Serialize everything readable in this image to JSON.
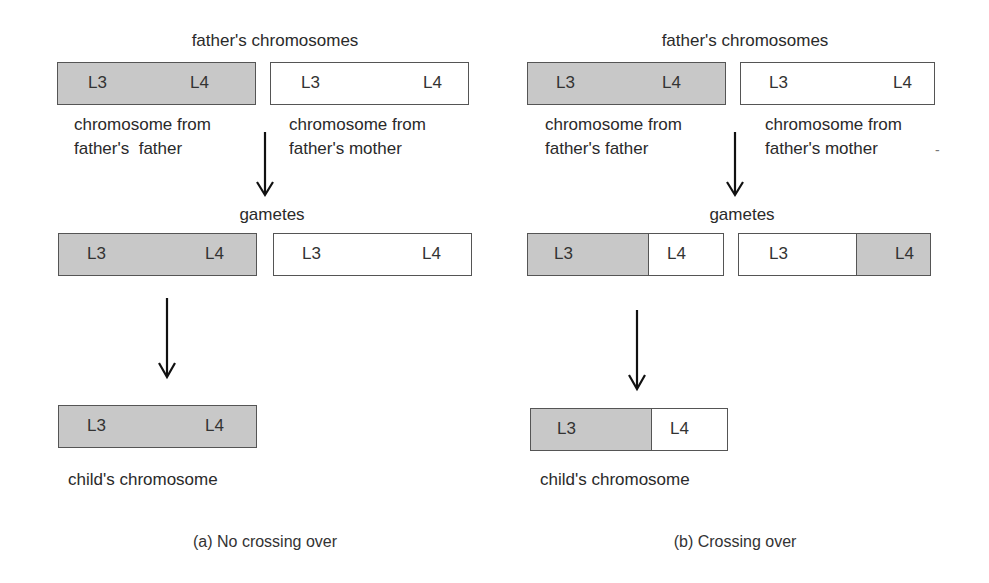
{
  "colors": {
    "maternal_segment": "#ffffff",
    "paternal_segment": "#c8c8c8",
    "outline": "#555555"
  },
  "panels": [
    {
      "id": "a",
      "caption": "(a) No crossing over",
      "parents_title": "father's chromosomes",
      "parent_chromosomes": [
        {
          "label_line1": "chromosome from",
          "label_line2": "father's  father",
          "loci": [
            "L3",
            "L4"
          ],
          "segments": [
            "grey"
          ]
        },
        {
          "label_line1": "chromosome from",
          "label_line2": "father's mother",
          "loci": [
            "L3",
            "L4"
          ],
          "segments": [
            "white"
          ]
        }
      ],
      "gametes_title": "gametes",
      "gametes": [
        {
          "loci": [
            "L3",
            "L4"
          ],
          "segments": [
            "grey"
          ]
        },
        {
          "loci": [
            "L3",
            "L4"
          ],
          "segments": [
            "white"
          ]
        }
      ],
      "child": {
        "label": "child's chromosome",
        "loci": [
          "L3",
          "L4"
        ],
        "segments": [
          "grey"
        ]
      }
    },
    {
      "id": "b",
      "caption": "(b) Crossing over",
      "parents_title": "father's chromosomes",
      "parent_chromosomes": [
        {
          "label_line1": "chromosome from",
          "label_line2": "father's father",
          "loci": [
            "L3",
            "L4"
          ],
          "segments": [
            "grey"
          ]
        },
        {
          "label_line1": "chromosome from",
          "label_line2": "father's mother",
          "loci": [
            "L3",
            "L4"
          ],
          "segments": [
            "white"
          ]
        }
      ],
      "gametes_title": "gametes",
      "gametes": [
        {
          "loci": [
            "L3",
            "L4"
          ],
          "segments": [
            "grey",
            "white"
          ]
        },
        {
          "loci": [
            "L3",
            "L4"
          ],
          "segments": [
            "white",
            "grey"
          ]
        }
      ],
      "child": {
        "label": "child's chromosome",
        "loci": [
          "L3",
          "L4"
        ],
        "segments": [
          "grey",
          "white"
        ]
      },
      "stray_mark": "-"
    }
  ]
}
